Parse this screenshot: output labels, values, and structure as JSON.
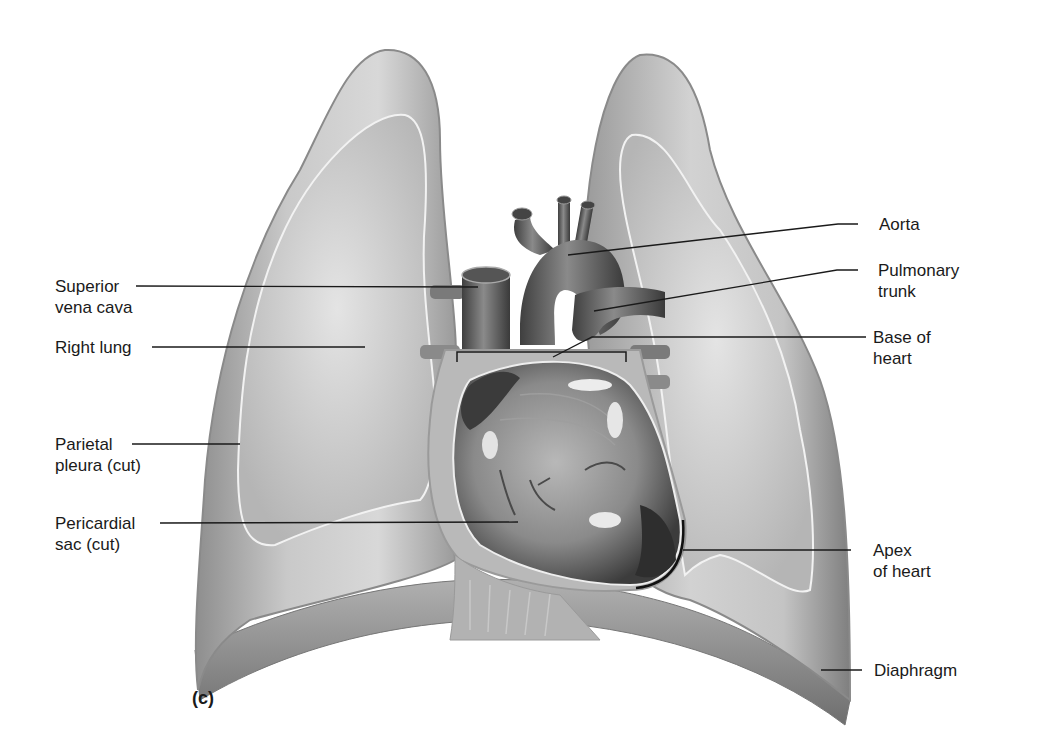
{
  "figure": {
    "panel_letter": "(c)",
    "colors": {
      "background": "#ffffff",
      "tissue_light": "#d4d4d4",
      "tissue_mid": "#a8a8a8",
      "tissue_dark": "#5a5a5a",
      "pleura_line": "#f0f0f0",
      "leader_line": "#1a1a1a",
      "text": "#1a1a1a"
    }
  },
  "labels": {
    "left": [
      {
        "id": "superior-vena-cava",
        "line1": "Superior",
        "line2": "vena cava"
      },
      {
        "id": "right-lung",
        "line1": "Right lung",
        "line2": ""
      },
      {
        "id": "parietal-pleura",
        "line1": "Parietal",
        "line2": "pleura (cut)"
      },
      {
        "id": "pericardial-sac",
        "line1": "Pericardial",
        "line2": "sac (cut)"
      }
    ],
    "right": [
      {
        "id": "aorta",
        "line1": "Aorta",
        "line2": ""
      },
      {
        "id": "pulmonary-trunk",
        "line1": "Pulmonary",
        "line2": "trunk"
      },
      {
        "id": "base-of-heart",
        "line1": "Base of",
        "line2": "heart"
      },
      {
        "id": "apex-of-heart",
        "line1": "Apex",
        "line2": "of heart"
      },
      {
        "id": "diaphragm",
        "line1": "Diaphragm",
        "line2": ""
      }
    ]
  }
}
